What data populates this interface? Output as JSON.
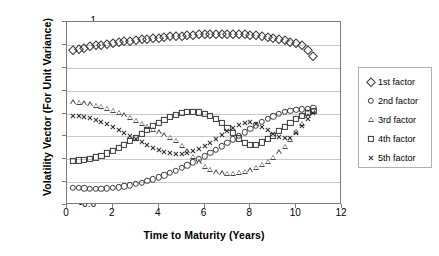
{
  "chart_data": {
    "type": "scatter",
    "title": "",
    "xlabel": "Time to Maturity (Years)",
    "ylabel": "Volatility Vector (For Unit Variance)",
    "xlim": [
      0,
      12
    ],
    "ylim": [
      -0.6,
      1
    ],
    "xticks": [
      0,
      2,
      4,
      6,
      8,
      10,
      12
    ],
    "yticks": [
      -0.6,
      -0.4,
      -0.2,
      0,
      0.2,
      0.4,
      0.6,
      0.8,
      1
    ],
    "grid": "horizontal",
    "legend_position": "right",
    "series": [
      {
        "name": "1st factor",
        "marker": "diamond",
        "x": [
          0.25,
          0.5,
          0.75,
          1,
          1.25,
          1.5,
          1.75,
          2,
          2.25,
          2.5,
          2.75,
          3,
          3.25,
          3.5,
          3.75,
          4,
          4.25,
          4.5,
          4.75,
          5,
          5.25,
          5.5,
          5.75,
          6,
          6.25,
          6.5,
          6.75,
          7,
          7.25,
          7.5,
          7.75,
          8,
          8.25,
          8.5,
          8.75,
          9,
          9.25,
          9.5,
          9.75,
          10,
          10.25,
          10.5,
          10.75
        ],
        "y": [
          0.757,
          0.767,
          0.777,
          0.787,
          0.795,
          0.803,
          0.81,
          0.817,
          0.824,
          0.83,
          0.836,
          0.842,
          0.848,
          0.854,
          0.859,
          0.864,
          0.869,
          0.874,
          0.878,
          0.882,
          0.886,
          0.889,
          0.892,
          0.895,
          0.897,
          0.898,
          0.899,
          0.899,
          0.898,
          0.896,
          0.893,
          0.889,
          0.884,
          0.878,
          0.871,
          0.863,
          0.853,
          0.842,
          0.829,
          0.814,
          0.797,
          0.76,
          0.7
        ]
      },
      {
        "name": "2nd factor",
        "marker": "circle",
        "x": [
          0.25,
          0.5,
          0.75,
          1,
          1.25,
          1.5,
          1.75,
          2,
          2.25,
          2.5,
          2.75,
          3,
          3.25,
          3.5,
          3.75,
          4,
          4.25,
          4.5,
          4.75,
          5,
          5.25,
          5.5,
          5.75,
          6,
          6.25,
          6.5,
          6.75,
          7,
          7.25,
          7.5,
          7.75,
          8,
          8.25,
          8.5,
          8.75,
          9,
          9.25,
          9.5,
          9.75,
          10,
          10.25,
          10.5,
          10.75
        ],
        "y": [
          -0.447,
          -0.452,
          -0.455,
          -0.457,
          -0.457,
          -0.456,
          -0.454,
          -0.45,
          -0.444,
          -0.436,
          -0.427,
          -0.416,
          -0.404,
          -0.39,
          -0.375,
          -0.358,
          -0.34,
          -0.32,
          -0.299,
          -0.276,
          -0.252,
          -0.227,
          -0.201,
          -0.174,
          -0.146,
          -0.117,
          -0.087,
          -0.057,
          -0.026,
          0.005,
          0.036,
          0.067,
          0.097,
          0.126,
          0.152,
          0.176,
          0.196,
          0.212,
          0.224,
          0.232,
          0.238,
          0.243,
          0.248
        ]
      },
      {
        "name": "3rd factor",
        "marker": "triangle",
        "x": [
          0.25,
          0.5,
          0.75,
          1,
          1.25,
          1.5,
          1.75,
          2,
          2.25,
          2.5,
          2.75,
          3,
          3.25,
          3.5,
          3.75,
          4,
          4.25,
          4.5,
          4.75,
          5,
          5.25,
          5.5,
          5.75,
          6,
          6.25,
          6.5,
          6.75,
          7,
          7.25,
          7.5,
          7.75,
          8,
          8.25,
          8.5,
          8.75,
          9,
          9.25,
          9.5,
          9.75,
          10,
          10.25,
          10.5,
          10.75
        ],
        "y": [
          0.3,
          0.296,
          0.29,
          0.281,
          0.27,
          0.257,
          0.242,
          0.224,
          0.205,
          0.184,
          0.161,
          0.137,
          0.112,
          0.086,
          0.06,
          0.035,
          0.01,
          -0.013,
          -0.036,
          -0.08,
          -0.13,
          -0.18,
          -0.225,
          -0.263,
          -0.292,
          -0.312,
          -0.323,
          -0.327,
          -0.326,
          -0.32,
          -0.31,
          -0.295,
          -0.275,
          -0.25,
          -0.22,
          -0.185,
          -0.14,
          -0.09,
          -0.03,
          0.04,
          0.11,
          0.175,
          0.225
        ]
      },
      {
        "name": "4th factor",
        "marker": "square",
        "x": [
          0.25,
          0.5,
          0.75,
          1,
          1.25,
          1.5,
          1.75,
          2,
          2.25,
          2.5,
          2.75,
          3,
          3.25,
          3.5,
          3.75,
          4,
          4.25,
          4.5,
          4.75,
          5,
          5.25,
          5.5,
          5.75,
          6,
          6.25,
          6.5,
          6.75,
          7,
          7.25,
          7.5,
          7.75,
          8,
          8.25,
          8.5,
          8.75,
          9,
          9.25,
          9.5,
          9.75,
          10,
          10.25,
          10.5,
          10.75
        ],
        "y": [
          -0.212,
          -0.21,
          -0.205,
          -0.196,
          -0.184,
          -0.168,
          -0.149,
          -0.127,
          -0.101,
          -0.073,
          -0.043,
          -0.011,
          0.022,
          0.055,
          0.088,
          0.118,
          0.146,
          0.17,
          0.19,
          0.205,
          0.213,
          0.215,
          0.21,
          0.198,
          0.178,
          0.15,
          0.115,
          0.073,
          0.027,
          -0.018,
          -0.055,
          -0.075,
          -0.072,
          -0.053,
          -0.025,
          0.008,
          0.045,
          0.082,
          0.118,
          0.152,
          0.182,
          0.205,
          0.22
        ]
      },
      {
        "name": "5th factor",
        "marker": "cross",
        "x": [
          0.25,
          0.5,
          0.75,
          1,
          1.25,
          1.5,
          1.75,
          2,
          2.25,
          2.5,
          2.75,
          3,
          3.25,
          3.5,
          3.75,
          4,
          4.25,
          4.5,
          4.75,
          5,
          5.25,
          5.5,
          5.75,
          6,
          6.25,
          6.5,
          6.75,
          7,
          7.25,
          7.5,
          7.75,
          8,
          8.25,
          8.5,
          8.75,
          9,
          9.25,
          9.5,
          9.75,
          10,
          10.25,
          10.5,
          10.75
        ],
        "y": [
          0.178,
          0.175,
          0.168,
          0.158,
          0.144,
          0.127,
          0.107,
          0.084,
          0.059,
          0.032,
          0.004,
          -0.024,
          -0.052,
          -0.078,
          -0.102,
          -0.122,
          -0.138,
          -0.148,
          -0.152,
          -0.15,
          -0.142,
          -0.128,
          -0.108,
          -0.083,
          -0.054,
          -0.022,
          0.012,
          0.046,
          0.078,
          0.104,
          0.12,
          0.122,
          0.11,
          0.086,
          0.056,
          0.025,
          -0.002,
          -0.018,
          -0.01,
          0.03,
          0.09,
          0.155,
          0.205
        ]
      }
    ]
  },
  "legend": {
    "items": [
      {
        "label": "1st factor",
        "marker": "diamond"
      },
      {
        "label": "2nd factor",
        "marker": "circle"
      },
      {
        "label": "3rd factor",
        "marker": "triangle"
      },
      {
        "label": "4th factor",
        "marker": "square"
      },
      {
        "label": "5th factor",
        "marker": "cross"
      }
    ]
  }
}
